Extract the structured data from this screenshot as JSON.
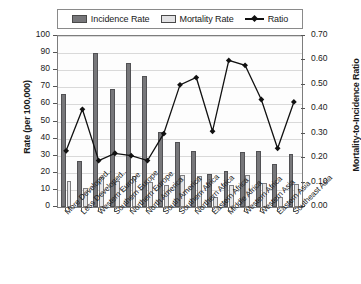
{
  "legend": {
    "items": [
      {
        "key": "incidence",
        "label": "Incidence Rate",
        "type": "bar",
        "color": "#77777a"
      },
      {
        "key": "mortality",
        "label": "Mortality Rate",
        "type": "bar",
        "color": "#e2e2e4"
      },
      {
        "key": "ratio",
        "label": "Ratio",
        "type": "line",
        "color": "#111111"
      }
    ]
  },
  "axes": {
    "left": {
      "title": "Rate (per 100,000)",
      "ticks": [
        "100",
        "90",
        "80",
        "70",
        "60",
        "50",
        "40",
        "30",
        "20",
        "10",
        "0"
      ],
      "min": 0,
      "max": 100,
      "step": 10
    },
    "right": {
      "title": "Mortality-to-Incidence Ratio",
      "ticks": [
        "0.70",
        "0.60",
        "0.50",
        "0.40",
        "0.30",
        "0.20",
        "0.10",
        "0.00"
      ],
      "min": 0,
      "max": 0.7,
      "step": 0.1
    }
  },
  "chart_data": {
    "type": "bar",
    "title": "",
    "xlabel": "",
    "ylabel": "Rate (per 100,000)",
    "y2label": "Mortality-to-Incidence Ratio",
    "ylim": [
      0,
      100
    ],
    "y2lim": [
      0,
      0.7
    ],
    "grid": true,
    "legend_position": "top",
    "categories": [
      "More Developed..",
      "Less Developed..",
      "Western Europe",
      "Southern Europe",
      "Northern Europe",
      "North America",
      "South America",
      "Southern Africa",
      "Northern Africa",
      "Eastern Africa",
      "Middle Africa",
      "Western Africa",
      "Western Asia",
      "Eastern Asia",
      "Southeast Asia"
    ],
    "series": [
      {
        "name": "Incidence Rate",
        "type": "bar",
        "axis": "left",
        "color": "#77777a",
        "values": [
          66,
          27,
          90,
          69,
          84,
          76.5,
          44,
          38,
          32.5,
          19.5,
          21,
          32,
          32.5,
          25,
          31
        ]
      },
      {
        "name": "Mortality Rate",
        "type": "bar",
        "axis": "left",
        "color": "#e2e2e4",
        "values": [
          15,
          11,
          17.5,
          15.5,
          18,
          14.5,
          13,
          19,
          18,
          6,
          13,
          18.5,
          14,
          6,
          13.5
        ]
      },
      {
        "name": "Ratio",
        "type": "line",
        "axis": "right",
        "color": "#111111",
        "values": [
          0.23,
          0.4,
          0.19,
          0.22,
          0.21,
          0.19,
          0.3,
          0.5,
          0.53,
          0.31,
          0.6,
          0.58,
          0.44,
          0.24,
          0.43
        ]
      }
    ]
  }
}
